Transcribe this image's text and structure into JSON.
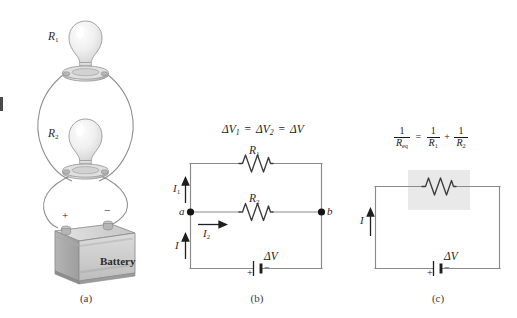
{
  "figure": {
    "background_color": "#ffffff",
    "wire_color": "#808080",
    "ink_color": "#2a2a2a",
    "highlight_color": "#e8e8e8"
  },
  "panels": {
    "a": {
      "caption": "(a)",
      "bulb_top_label": "R",
      "bulb_top_sub": "1",
      "bulb_bottom_label": "R",
      "bulb_bottom_sub": "2",
      "battery_label": "Battery",
      "terminal_positive": "+",
      "terminal_negative": "−"
    },
    "b": {
      "caption": "(b)",
      "equation": {
        "delta": "Δ",
        "v": "V",
        "sub1": "1",
        "sub2": "2",
        "eq": "=",
        "full_text": "ΔV1 = ΔV2 = ΔV"
      },
      "resistor_top_label": "R",
      "resistor_top_sub": "1",
      "resistor_mid_label": "R",
      "resistor_mid_sub": "2",
      "node_a_label": "a",
      "node_b_label": "b",
      "current_top_label": "I",
      "current_top_sub": "1",
      "current_mid_label": "I",
      "current_mid_sub": "2",
      "current_bottom_label": "I",
      "battery_label_delta": "Δ",
      "battery_label_v": "V",
      "battery_plus": "+",
      "battery_minus": "−"
    },
    "c": {
      "caption": "(c)",
      "equation": {
        "one": "1",
        "r_eq": "R",
        "r_eq_sub": "eq",
        "r1": "R",
        "r1_sub": "1",
        "r2": "R",
        "r2_sub": "2",
        "equals": "=",
        "plus": "+",
        "full_text": "1/Req = 1/R1 + 1/R2"
      },
      "current_label": "I",
      "battery_label_delta": "Δ",
      "battery_label_v": "V",
      "battery_plus": "+",
      "battery_minus": "−"
    }
  }
}
